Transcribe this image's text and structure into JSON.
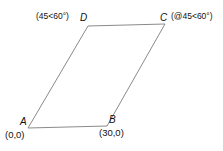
{
  "figure": {
    "name": "parallelogram-diagram",
    "background_color": "#ffffff",
    "stroke_color": "#8a8a8a",
    "stroke_width": 1,
    "vertices": {
      "A": {
        "label": "A",
        "x": 28,
        "y": 128,
        "coordinate_text": "(0,0)"
      },
      "B": {
        "label": "B",
        "x": 107,
        "y": 126,
        "coordinate_text": "(30,0)"
      },
      "C": {
        "label": "C",
        "x": 165,
        "y": 24,
        "annotation_text": "(@45<60°)"
      },
      "D": {
        "label": "D",
        "x": 88,
        "y": 26,
        "annotation_text": "(45<60°)"
      }
    },
    "edges": [
      {
        "name": "edge-a-b",
        "from": "A",
        "to": "B"
      },
      {
        "name": "edge-b-c",
        "from": "B",
        "to": "C"
      },
      {
        "name": "edge-c-d",
        "from": "C",
        "to": "D"
      },
      {
        "name": "edge-d-a",
        "from": "D",
        "to": "A"
      }
    ]
  }
}
